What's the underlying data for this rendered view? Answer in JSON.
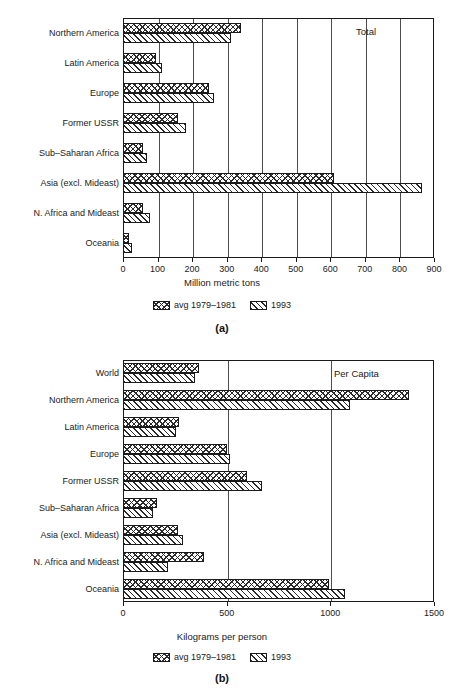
{
  "figure": {
    "panels": [
      {
        "id": "a",
        "caption": "(a)",
        "corner_note": "Total",
        "chart_data": {
          "type": "bar",
          "orientation": "horizontal",
          "title": "",
          "xlabel": "Million metric tons",
          "ylabel": "",
          "xlim": [
            0,
            900
          ],
          "xticks": [
            0,
            100,
            200,
            300,
            400,
            500,
            600,
            700,
            800,
            900
          ],
          "grid": true,
          "legend_position": "below",
          "annotation": "Total",
          "categories": [
            "Northern America",
            "Latin America",
            "Europe",
            "Former USSR",
            "Sub–Saharan Africa",
            "Asia (excl. Mideast)",
            "N. Africa and Mideast",
            "Oceania"
          ],
          "series": [
            {
              "name": "avg 1979–1981",
              "values": [
                341,
                95,
                250,
                158,
                57,
                610,
                57,
                17
              ]
            },
            {
              "name": "1993",
              "values": [
                312,
                112,
                262,
                182,
                70,
                865,
                78,
                25
              ]
            }
          ]
        }
      },
      {
        "id": "b",
        "caption": "(b)",
        "corner_note": "Per Capita",
        "chart_data": {
          "type": "bar",
          "orientation": "horizontal",
          "title": "",
          "xlabel": "Kilograms per person",
          "ylabel": "",
          "xlim": [
            0,
            1500
          ],
          "xticks": [
            0,
            500,
            1000,
            1500
          ],
          "grid": true,
          "legend_position": "below",
          "annotation": "Per Capita",
          "categories": [
            "World",
            "Northern America",
            "Latin America",
            "Europe",
            "Former USSR",
            "Sub–Saharan Africa",
            "Asia (excl. Mideast)",
            "N. Africa and Mideast",
            "Oceania"
          ],
          "series": [
            {
              "name": "avg 1979–1981",
              "values": [
                365,
                1380,
                270,
                500,
                600,
                165,
                265,
                390,
                995
              ]
            },
            {
              "name": "1993",
              "values": [
                345,
                1095,
                255,
                515,
                670,
                145,
                290,
                215,
                1070
              ]
            }
          ]
        }
      }
    ],
    "legend": {
      "entries": [
        {
          "label": "avg 1979–1981",
          "pattern": "crosshatch"
        },
        {
          "label": "1993",
          "pattern": "diagonal-hatch"
        }
      ]
    },
    "colors": {
      "ink": "#1a1a1a",
      "hatch": "#2b2b2b",
      "background": "#ffffff"
    }
  }
}
